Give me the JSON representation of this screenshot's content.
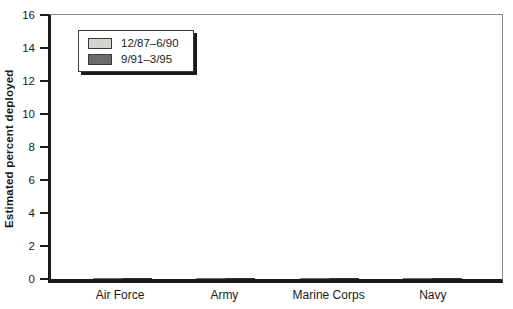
{
  "chart_data": {
    "type": "bar",
    "title": "",
    "xlabel": "",
    "ylabel": "Estimated percent deployed",
    "ylim": [
      0,
      16
    ],
    "yticks": [
      0,
      2,
      4,
      6,
      8,
      10,
      12,
      14,
      16
    ],
    "grid": false,
    "legend_position": "top-left-inside",
    "categories": [
      "Air Force",
      "Army",
      "Marine Corps",
      "Navy"
    ],
    "series": [
      {
        "name": "12/87–6/90",
        "values": [
          2.2,
          5.2,
          11.5,
          11.3
        ],
        "color": "#d4d4d1",
        "border": "#6e6e6e"
      },
      {
        "name": "9/91–3/95",
        "values": [
          6.2,
          8.4,
          12.9,
          14.3
        ],
        "color": "#6c6c6c",
        "border": "#333333"
      }
    ]
  },
  "colors": {
    "axis": "#1a1a1a",
    "plot_border": "#8a8a8a",
    "background": "#ffffff",
    "legend_shadow": "#1a1a1a"
  }
}
